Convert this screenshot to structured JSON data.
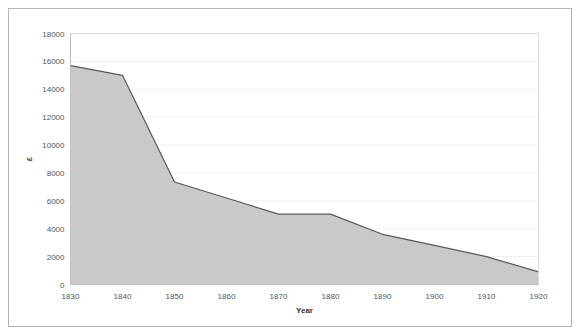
{
  "figure": {
    "background_color": "#ffffff",
    "frame_color": "#b3b3b3"
  },
  "chart_data": {
    "type": "area",
    "title": "",
    "subtitle": "",
    "xlabel": "Year",
    "ylabel": "£",
    "x": [
      1830,
      1840,
      1850,
      1860,
      1870,
      1880,
      1890,
      1900,
      1910,
      1920
    ],
    "values": [
      15700,
      15000,
      7350,
      6200,
      5050,
      5050,
      3600,
      2800,
      2000,
      900
    ],
    "series": [
      {
        "name": "£",
        "values": [
          15700,
          15000,
          7350,
          6200,
          5050,
          5050,
          3600,
          2800,
          2000,
          900
        ]
      }
    ],
    "categories": [
      "1830",
      "1840",
      "1850",
      "1860",
      "1870",
      "1880",
      "1890",
      "1900",
      "1910",
      "1920"
    ],
    "xlim": [
      1830,
      1920
    ],
    "ylim": [
      0,
      18000
    ],
    "xticks": [
      1830,
      1840,
      1850,
      1860,
      1870,
      1880,
      1890,
      1900,
      1910,
      1920
    ],
    "xtick_labels": [
      "1830",
      "1840",
      "1850",
      "1860",
      "1870",
      "1880",
      "1890",
      "1900",
      "1910",
      "1920"
    ],
    "yticks": [
      0,
      2000,
      4000,
      6000,
      8000,
      10000,
      12000,
      14000,
      16000,
      18000
    ],
    "ytick_labels": [
      "0",
      "2000",
      "4000",
      "6000",
      "8000",
      "10000",
      "12000",
      "14000",
      "16000",
      "18000"
    ],
    "grid": true,
    "grid_axis": "y",
    "legend": false,
    "legend_position": "none",
    "area_fill_color": "#c9c9c9",
    "line_color": "#595959",
    "gridline_color": "#f0f0f0",
    "axis_color": "#bfbfbf",
    "annotations": []
  }
}
